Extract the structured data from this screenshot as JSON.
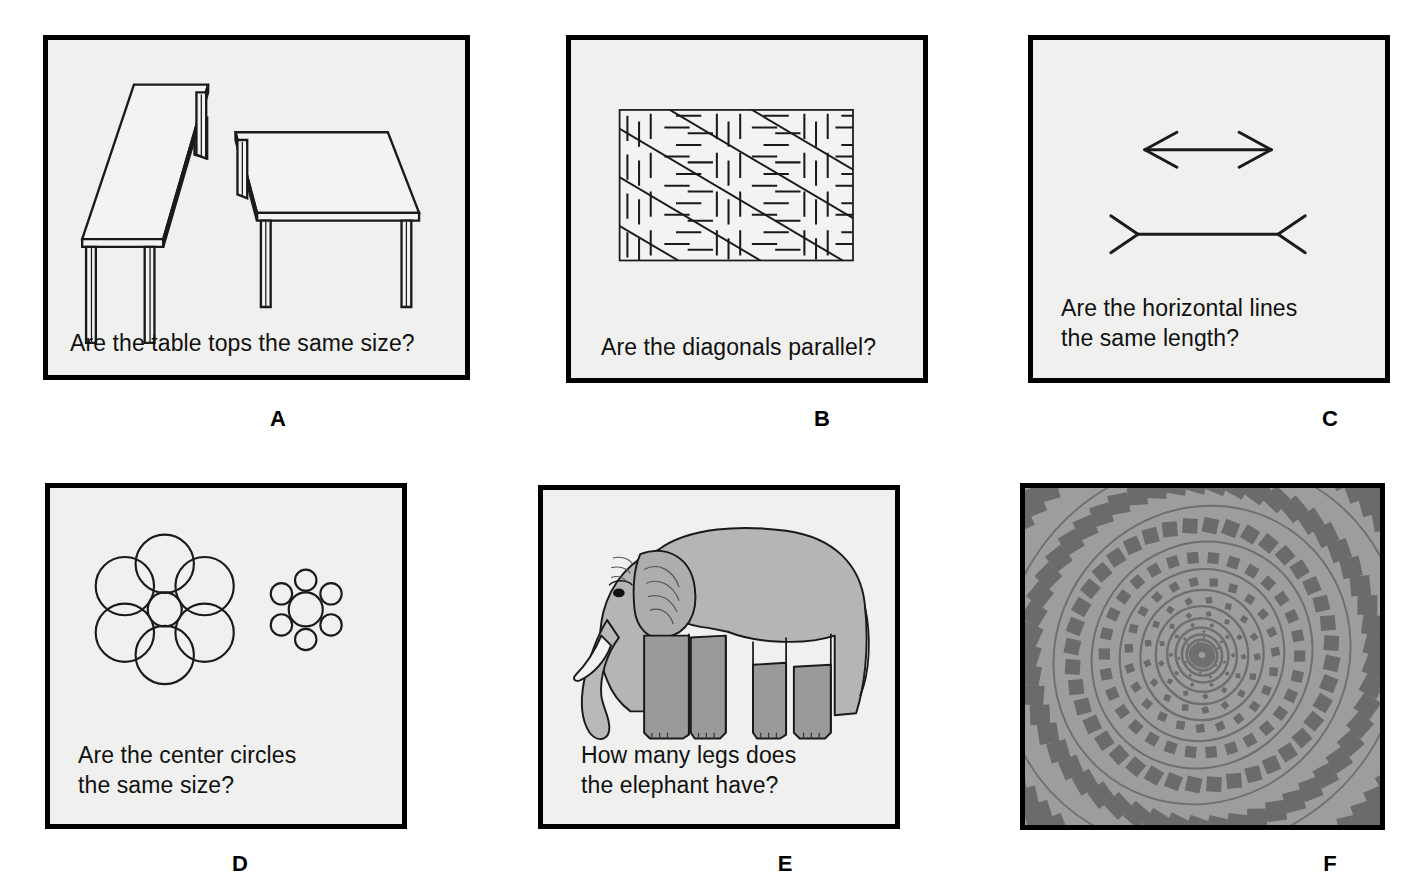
{
  "figure": {
    "panel_count": 6,
    "background_color": "#ffffff",
    "panel_background_color": "#f0f0ee",
    "panel_border_color": "#000000",
    "ink_color": "#111111"
  },
  "panels": [
    {
      "id": "A",
      "label": "A",
      "caption": "Are the table tops the same size?",
      "illusion_name": "shepard-tables",
      "art_description": "Two line-drawn tables in perspective: one long narrow table angled to the left, one wider table angled to the right."
    },
    {
      "id": "B",
      "label": "B",
      "caption": "Are the diagonals parallel?",
      "illusion_name": "zollner-lines",
      "art_description": "Rectangle filled with long parallel diagonal lines crossed by short alternating hatch marks."
    },
    {
      "id": "C",
      "label": "C",
      "caption": "Are the horizontal lines\nthe same length?",
      "illusion_name": "muller-lyer-arrows",
      "art_description": "Two horizontal lines: top one with outward arrowheads, bottom one with inward fins."
    },
    {
      "id": "D",
      "label": "D",
      "caption": "Are the center circles\nthe same size?",
      "illusion_name": "ebbinghaus-circles",
      "art_description": "Left: small center circle surrounded by six large circles. Right: same-size center circle surrounded by six small circles."
    },
    {
      "id": "E",
      "label": "E",
      "caption": "How many legs does\nthe elephant have?",
      "illusion_name": "impossible-elephant",
      "art_description": "Gray cartoon elephant in profile whose legs and gaps between them are ambiguous."
    },
    {
      "id": "F",
      "label": "F",
      "caption": "",
      "illusion_name": "fraser-spiral",
      "art_description": "Gray square of concentric twisted rings on a checkerboard of dark diamonds, appearing as a spiral.",
      "background_color": "#9a9a9a",
      "ring_color": "#6f6f6f",
      "diamond_color": "#6b6b6b"
    }
  ]
}
